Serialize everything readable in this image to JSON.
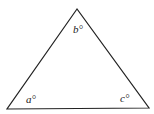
{
  "diagram": {
    "type": "triangle",
    "stroke_color": "#222222",
    "vertices": {
      "top": [
        77,
        9
      ],
      "bottom_left": [
        7,
        109
      ],
      "bottom_right": [
        149,
        108
      ]
    },
    "angle_labels": {
      "top": "b°",
      "bottom_left": "a°",
      "bottom_right": "c°"
    }
  }
}
